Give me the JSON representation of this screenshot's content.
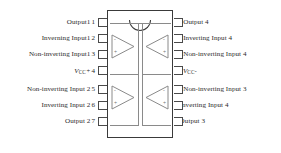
{
  "diagram": {
    "package": {
      "name": "dip-14-package",
      "notch": "semicircular-notch",
      "pin_count": 14
    },
    "colors": {
      "outline": "#3a3a3a",
      "rail": "#8a8a8a",
      "text": "#2b2b2b",
      "background": "#ffffff"
    }
  },
  "pins": {
    "left": [
      {
        "number": "1",
        "label": "Output1"
      },
      {
        "number": "2",
        "label": "Inverning Input1"
      },
      {
        "number": "3",
        "label": "Non-inverting Input1"
      },
      {
        "number": "4",
        "label": "VCC+",
        "is_supply": true,
        "sym": "V",
        "sub": "CC",
        "sign": "+"
      },
      {
        "number": "5",
        "label": "Non-inverting Input 2"
      },
      {
        "number": "6",
        "label": "Inverting Input 2"
      },
      {
        "number": "7",
        "label": "Output 2"
      }
    ],
    "right": [
      {
        "number": "14",
        "label": "Output 4"
      },
      {
        "number": "13",
        "label": "Inverting Input 4"
      },
      {
        "number": "12",
        "label": "Non-inverting Input 4"
      },
      {
        "number": "11",
        "label": "VCC-",
        "is_supply": true,
        "sym": "V",
        "sub": "CC",
        "sign": "-"
      },
      {
        "number": "10",
        "label": "Non-inverting Input 3"
      },
      {
        "number": "9",
        "label": "Inverting Input 4"
      },
      {
        "number": "8",
        "label": "Output 3"
      }
    ]
  },
  "amplifiers": [
    {
      "id": "amp-1",
      "position": "top-left",
      "inverting_sign": "-",
      "noninverting_sign": "+"
    },
    {
      "id": "amp-4",
      "position": "top-right",
      "inverting_sign": "-",
      "noninverting_sign": "+"
    },
    {
      "id": "amp-2",
      "position": "bottom-left",
      "inverting_sign": "-",
      "noninverting_sign": "+"
    },
    {
      "id": "amp-3",
      "position": "bottom-right",
      "inverting_sign": "-",
      "noninverting_sign": "+"
    }
  ]
}
